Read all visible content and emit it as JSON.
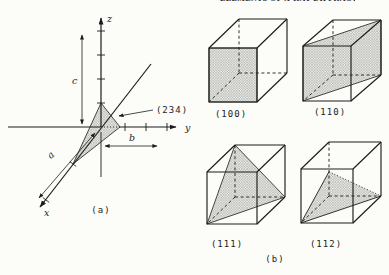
{
  "page_header": {
    "running_title": "ELEMENTS OF X-RAY DIFFRACTION"
  },
  "figure": {
    "panel_a": {
      "caption": "(a)",
      "axes": {
        "x": "x",
        "y": "y",
        "z": "z"
      },
      "lattice_params": {
        "a": "a",
        "b": "b",
        "c": "c"
      },
      "plane_annotation": "(234)"
    },
    "panel_b": {
      "caption": "(b)",
      "cubes": [
        {
          "miller_index": "(100)"
        },
        {
          "miller_index": "(110)"
        },
        {
          "miller_index": "(111)"
        },
        {
          "miller_index": "(112)"
        }
      ]
    }
  }
}
